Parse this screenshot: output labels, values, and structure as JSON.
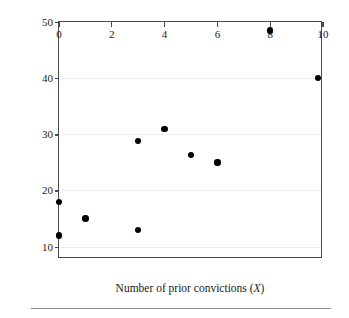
{
  "chart_data": {
    "type": "scatter",
    "title": "",
    "xlabel": "Number of prior convictions (X)",
    "xlabel_text": "Number of prior convictions (",
    "xlabel_var": "X",
    "xlabel_tail": ")",
    "ylabel": "Sentence length (Y)",
    "ylabel_text": "Sentence length (",
    "ylabel_var": "Y",
    "ylabel_tail": ")",
    "xlim": [
      0,
      10
    ],
    "ylim": [
      7.8,
      50
    ],
    "xticks": [
      0,
      2,
      4,
      6,
      8,
      10
    ],
    "xtick_labels": [
      "0",
      "2",
      "4",
      "6",
      "8",
      "10"
    ],
    "yticks": [
      10,
      20,
      30,
      40,
      50
    ],
    "ytick_labels": [
      "10",
      "20",
      "30",
      "40",
      "50"
    ],
    "grid": "horizontal",
    "grid_color": "#ececec",
    "legend": null,
    "marker_color": "#000000",
    "frame_color": "#4a4a4a",
    "x": [
      0,
      0,
      1,
      3,
      3,
      4,
      5,
      6,
      8,
      9.8
    ],
    "y": [
      18,
      12,
      15,
      28.8,
      13,
      31,
      26.3,
      25,
      48.5,
      40
    ],
    "points": [
      {
        "x": 0,
        "y": 18
      },
      {
        "x": 0,
        "y": 12
      },
      {
        "x": 1,
        "y": 15
      },
      {
        "x": 3,
        "y": 28.8
      },
      {
        "x": 3,
        "y": 13
      },
      {
        "x": 4,
        "y": 31
      },
      {
        "x": 5,
        "y": 26.3
      },
      {
        "x": 6,
        "y": 25
      },
      {
        "x": 8,
        "y": 48.5
      },
      {
        "x": 9.8,
        "y": 40
      }
    ]
  }
}
